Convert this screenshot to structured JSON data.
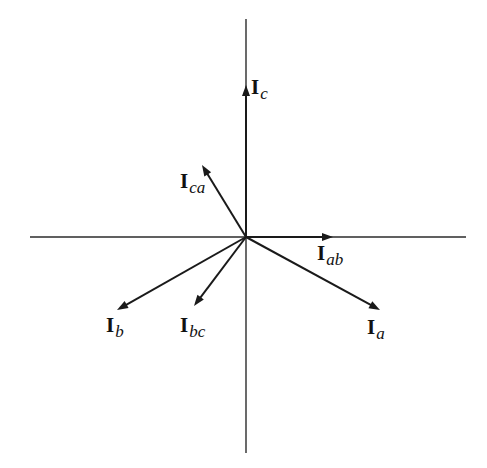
{
  "diagram": {
    "type": "phasor-diagram",
    "origin": {
      "x": 246,
      "y": 237
    },
    "axes": {
      "horizontal": {
        "x1": 30,
        "y1": 237,
        "x2": 466,
        "y2": 237
      },
      "vertical": {
        "x1": 246,
        "y1": 19,
        "x2": 246,
        "y2": 453
      }
    },
    "colors": {
      "line": "#1a1a1a",
      "axis": "#2b2b2b",
      "background": "#ffffff"
    },
    "vectors": [
      {
        "id": "Ic",
        "main": "I",
        "sub": "c",
        "tip": {
          "x": 246,
          "y": 85
        },
        "label_pos": {
          "x": 251,
          "y": 77
        }
      },
      {
        "id": "Ica",
        "main": "I",
        "sub": "ca",
        "tip": {
          "x": 202,
          "y": 165
        },
        "label_pos": {
          "x": 180,
          "y": 171
        }
      },
      {
        "id": "Iab",
        "main": "I",
        "sub": "ab",
        "tip": {
          "x": 333,
          "y": 237
        },
        "label_pos": {
          "x": 317,
          "y": 243
        }
      },
      {
        "id": "Ia",
        "main": "I",
        "sub": "a",
        "tip": {
          "x": 380,
          "y": 310
        },
        "label_pos": {
          "x": 367,
          "y": 317
        }
      },
      {
        "id": "Ib",
        "main": "I",
        "sub": "b",
        "tip": {
          "x": 117,
          "y": 310
        },
        "label_pos": {
          "x": 106,
          "y": 315
        }
      },
      {
        "id": "Ibc",
        "main": "I",
        "sub": "bc",
        "tip": {
          "x": 194,
          "y": 306
        },
        "label_pos": {
          "x": 180,
          "y": 315
        }
      }
    ]
  }
}
